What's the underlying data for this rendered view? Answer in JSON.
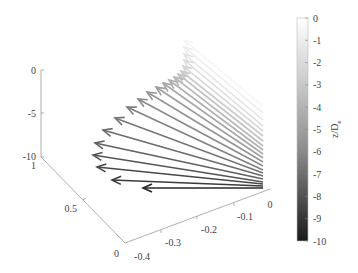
{
  "chart_data": {
    "type": "quiver3d",
    "title": "",
    "xlabel": "",
    "ylabel": "",
    "zlabel": "",
    "x_ticks": [
      "-0.4",
      "-0.3",
      "-0.2",
      "-0.1",
      "0"
    ],
    "y_ticks": [
      "0",
      "0.5",
      "1"
    ],
    "z_ticks": [
      "-10",
      "-5",
      "0"
    ],
    "xlim": [
      -0.4,
      0
    ],
    "ylim": [
      0,
      1
    ],
    "zlim": [
      -10,
      0
    ],
    "colorbar": {
      "label": "z/D",
      "label_subscript": "e",
      "ticks": [
        "0",
        "-1",
        "-2",
        "-3",
        "-4",
        "-5",
        "-6",
        "-7",
        "-8",
        "-9",
        "-10"
      ],
      "range": [
        -10,
        0
      ],
      "colormap": "gray",
      "color_low": "#1a1a1a",
      "color_high": "#ffffff"
    },
    "arrows": [
      {
        "z": -10.0,
        "base": [
          263,
          188
        ],
        "tip": [
          143,
          188
        ]
      },
      {
        "z": -9.5,
        "base": [
          263,
          186
        ],
        "tip": [
          112,
          180
        ]
      },
      {
        "z": -9.0,
        "base": [
          263,
          184
        ],
        "tip": [
          97,
          167
        ]
      },
      {
        "z": -8.5,
        "base": [
          263,
          182
        ],
        "tip": [
          93,
          155
        ]
      },
      {
        "z": -8.0,
        "base": [
          263,
          179
        ],
        "tip": [
          95,
          143
        ]
      },
      {
        "z": -7.5,
        "base": [
          263,
          176
        ],
        "tip": [
          103,
          130
        ]
      },
      {
        "z": -7.0,
        "base": [
          263,
          173
        ],
        "tip": [
          115,
          118
        ]
      },
      {
        "z": -6.5,
        "base": [
          263,
          170
        ],
        "tip": [
          127,
          107
        ]
      },
      {
        "z": -6.0,
        "base": [
          263,
          166
        ],
        "tip": [
          138,
          99
        ]
      },
      {
        "z": -5.5,
        "base": [
          263,
          162
        ],
        "tip": [
          147,
          92
        ]
      },
      {
        "z": -5.0,
        "base": [
          263,
          158
        ],
        "tip": [
          156,
          87
        ]
      },
      {
        "z": -4.5,
        "base": [
          263,
          154
        ],
        "tip": [
          163,
          83
        ]
      },
      {
        "z": -4.0,
        "base": [
          263,
          150
        ],
        "tip": [
          169,
          80
        ]
      },
      {
        "z": -3.5,
        "base": [
          263,
          146
        ],
        "tip": [
          174,
          77
        ]
      },
      {
        "z": -3.0,
        "base": [
          263,
          141
        ],
        "tip": [
          178,
          74
        ]
      },
      {
        "z": -2.5,
        "base": [
          263,
          136
        ],
        "tip": [
          181,
          71
        ]
      },
      {
        "z": -2.0,
        "base": [
          263,
          131
        ],
        "tip": [
          183,
          66
        ]
      },
      {
        "z": -1.5,
        "base": [
          263,
          126
        ],
        "tip": [
          184,
          60
        ]
      },
      {
        "z": -1.0,
        "base": [
          263,
          120
        ],
        "tip": [
          184,
          54
        ]
      },
      {
        "z": -0.5,
        "base": [
          263,
          113
        ],
        "tip": [
          184,
          47
        ]
      },
      {
        "z": 0.0,
        "base": [
          263,
          106
        ],
        "tip": [
          184,
          40
        ]
      }
    ]
  }
}
